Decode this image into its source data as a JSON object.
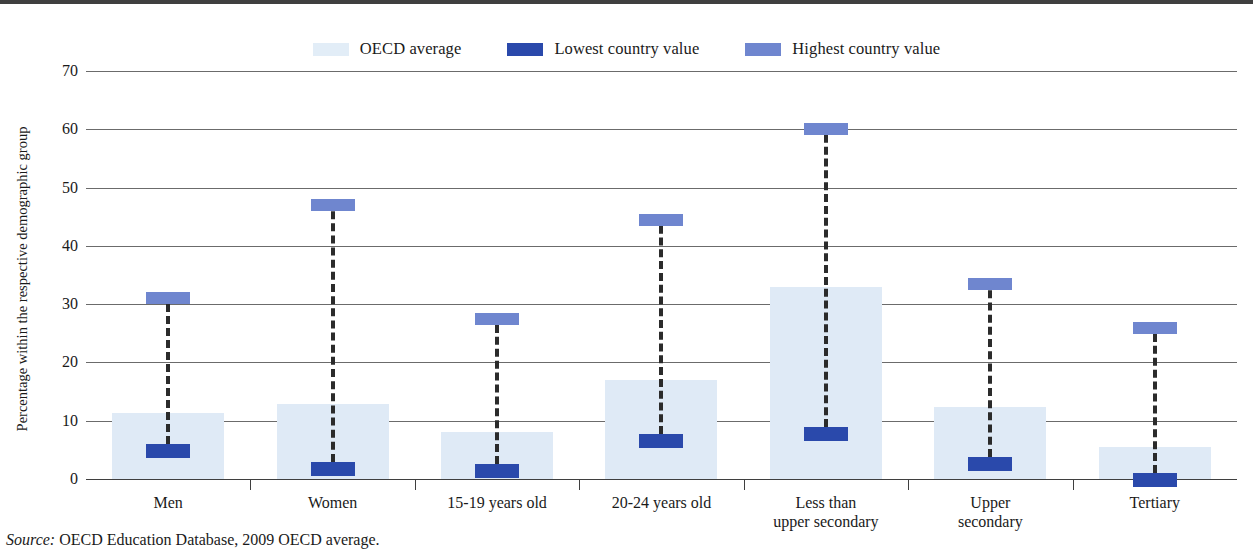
{
  "legend": {
    "items": [
      {
        "label": "OECD average",
        "color": "#e2edf7",
        "icon": "legend-swatch-oecd-average"
      },
      {
        "label": "Lowest country value",
        "color": "#2a49ab",
        "icon": "legend-swatch-lowest-country-value"
      },
      {
        "label": "Highest country value",
        "color": "#6f86cf",
        "icon": "legend-swatch-highest-country-value"
      }
    ]
  },
  "axis": {
    "y_title": "Percentage within the respective demographic group",
    "y_ticks": [
      "70",
      "60",
      "50",
      "40",
      "30",
      "20",
      "10",
      "0"
    ]
  },
  "source": {
    "prefix": "Source:",
    "text": " OECD Education Database, 2009 OECD average."
  },
  "chart_data": {
    "type": "bar",
    "title": "",
    "xlabel": "",
    "ylabel": "Percentage within the respective demographic group",
    "ylim": [
      0,
      70
    ],
    "ytick_step": 10,
    "grid": true,
    "legend_position": "top-center",
    "categories": [
      "Men",
      "Women",
      "15-19 years old",
      "20-24 years old",
      "Less than\nupper secondary",
      "Upper\nsecondary",
      "Tertiary"
    ],
    "category_lines": [
      [
        "Men"
      ],
      [
        "Women"
      ],
      [
        "15-19 years old"
      ],
      [
        "20-24 years old"
      ],
      [
        "Less than",
        "upper secondary"
      ],
      [
        "Upper",
        "secondary"
      ],
      [
        "Tertiary"
      ]
    ],
    "series": [
      {
        "name": "OECD average",
        "values": [
          11.3,
          12.8,
          8.0,
          17.0,
          33.0,
          12.3,
          5.5
        ]
      },
      {
        "name": "Lowest country value",
        "values": [
          6.0,
          3.0,
          2.5,
          7.7,
          9.0,
          3.8,
          1.0
        ]
      },
      {
        "name": "Highest country value",
        "values": [
          32.0,
          48.0,
          28.5,
          45.5,
          61.0,
          34.5,
          27.0
        ]
      }
    ],
    "colors": {
      "oecd_average": "#e2edf7",
      "lowest_country_value": "#2a49ab",
      "highest_country_value": "#6f86cf",
      "gridline": "#6b6b6b",
      "axis": "#3f3f3f"
    }
  }
}
